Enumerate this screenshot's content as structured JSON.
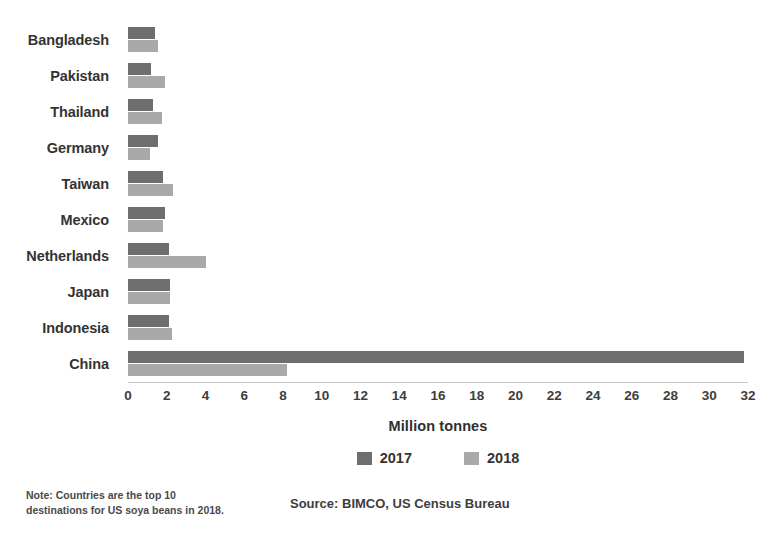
{
  "chart_data": {
    "type": "bar",
    "orientation": "horizontal",
    "title": "",
    "xlabel": "Million tonnes",
    "ylabel": "",
    "xlim": [
      0,
      32
    ],
    "xticks": [
      0,
      2,
      4,
      6,
      8,
      10,
      12,
      14,
      16,
      18,
      20,
      22,
      24,
      26,
      28,
      30,
      32
    ],
    "grid": false,
    "legend_position": "bottom-center",
    "categories": [
      "Bangladesh",
      "Pakistan",
      "Thailand",
      "Germany",
      "Taiwan",
      "Mexico",
      "Netherlands",
      "Japan",
      "Indonesia",
      "China"
    ],
    "series": [
      {
        "name": "2017",
        "color": "#6e6e6e",
        "values": [
          1.4,
          1.2,
          1.3,
          1.55,
          1.8,
          1.9,
          2.1,
          2.15,
          2.1,
          31.8
        ]
      },
      {
        "name": "2018",
        "color": "#a9a9a9",
        "values": [
          1.55,
          1.9,
          1.75,
          1.15,
          2.3,
          1.8,
          4.0,
          2.15,
          2.25,
          8.2
        ]
      }
    ],
    "note": "Note: Countries are the top 10 destinations for US soya beans in 2018.",
    "source": "Source: BIMCO, US Census Bureau"
  },
  "axis": {
    "title": "Million tonnes"
  },
  "legend": {
    "items": [
      {
        "label": "2017",
        "color": "#6e6e6e"
      },
      {
        "label": "2018",
        "color": "#a9a9a9"
      }
    ]
  },
  "footer": {
    "note_line_1": "Note: Countries are the top 10",
    "note_line_2": "destinations for US soya beans in 2018.",
    "source": "Source: BIMCO, US Census Bureau"
  },
  "colors": {
    "series_2017": "#6e6e6e",
    "series_2018": "#a9a9a9",
    "axis_line": "#c9c9c9",
    "text": "#333333",
    "background": "#ffffff"
  }
}
